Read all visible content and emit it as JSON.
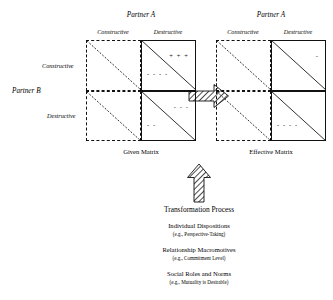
{
  "figure": {
    "given": {
      "caption": "Given Matrix",
      "column_group_label": "Partner A",
      "columns": [
        "Constructive",
        "Destructive"
      ],
      "row_group_label": "Partner B",
      "rows": [
        "Constructive",
        "Destructive"
      ],
      "cells": {
        "tl": {
          "upper": "",
          "lower": ""
        },
        "tr": {
          "upper": "+ + +",
          "lower": "- - - -"
        },
        "bl": {
          "upper": "",
          "lower": ""
        },
        "br": {
          "upper": "- - -",
          "lower": "- -"
        }
      }
    },
    "effective": {
      "caption": "Effective Matrix",
      "column_group_label": "Partner A",
      "columns": [
        "Constructive",
        "Destructive"
      ],
      "cells": {
        "tl": {
          "upper": "",
          "lower": ""
        },
        "tr": {
          "upper": "-",
          "lower": ""
        },
        "bl": {
          "upper": "",
          "lower": ""
        },
        "br": {
          "upper": "",
          "lower": "- - - -"
        }
      }
    },
    "transformation": {
      "title": "Transformation Process",
      "factors": [
        {
          "name": "Individual Dispositions",
          "example": "(e.g., Perspective-Taking)"
        },
        {
          "name": "Relationship Macromotives",
          "example": "(e.g., Commitment Level)"
        },
        {
          "name": "Social Roles and Norms",
          "example": "(e.g., Mutuality is Desirable)"
        }
      ]
    },
    "colors": {
      "line": "#111111",
      "background": "#ffffff"
    }
  }
}
